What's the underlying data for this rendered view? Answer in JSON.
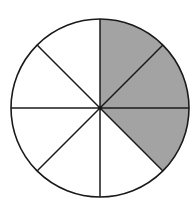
{
  "diagram": {
    "type": "fraction-circle",
    "total_sectors": 8,
    "shaded_sectors": [
      0,
      1,
      2
    ],
    "shaded_fraction": "3/8",
    "start_angle_deg": -90,
    "direction": "clockwise",
    "center": [
      100,
      108
    ],
    "radius": 89,
    "colors": {
      "shaded": "#a3a3a3",
      "unshaded": "#ffffff",
      "stroke": "#1a1a1a",
      "background": "#ffffff"
    }
  }
}
